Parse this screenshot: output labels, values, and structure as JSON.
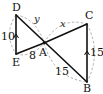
{
  "diagram": {
    "type": "geometry",
    "points": {
      "D": {
        "label": "D",
        "x": 16,
        "y": 15
      },
      "E": {
        "label": "E",
        "x": 16,
        "y": 54
      },
      "A": {
        "label": "A",
        "x": 44,
        "y": 43
      },
      "C": {
        "label": "C",
        "x": 87,
        "y": 24
      },
      "B": {
        "label": "B",
        "x": 87,
        "y": 82
      }
    },
    "segments": [
      {
        "from": "D",
        "to": "E",
        "length_label": "10",
        "parallel_arrow": true
      },
      {
        "from": "E",
        "to": "A",
        "length_label": "8"
      },
      {
        "from": "D",
        "to": "A",
        "length_label": "y"
      },
      {
        "from": "A",
        "to": "C",
        "length_label": "x"
      },
      {
        "from": "A",
        "to": "B",
        "length_label": "15"
      },
      {
        "from": "C",
        "to": "B",
        "length_label": "15",
        "parallel_arrow": true
      }
    ],
    "labels": {
      "D": "D",
      "E": "E",
      "A": "A",
      "C": "C",
      "B": "B",
      "de": "10",
      "ea": "8",
      "da": "y",
      "ac": "x",
      "ab": "15",
      "cb": "15"
    },
    "colors": {
      "line": "#111111",
      "arc": "#9a9a9a",
      "background": "#ffffff"
    }
  }
}
